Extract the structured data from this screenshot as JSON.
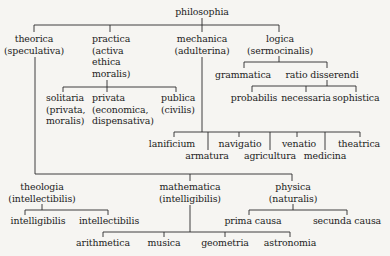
{
  "diagram": {
    "root": "philosophia",
    "level1": {
      "theorica": [
        "theorica",
        "(speculativa)"
      ],
      "practica": [
        "practica",
        "(activa",
        "ethica",
        "moralis)"
      ],
      "mechanica": [
        "mechanica",
        "(adulterina)"
      ],
      "logica": [
        "logica",
        "(sermocinalis)"
      ]
    },
    "practica_children": {
      "solitaria": [
        "solitaria",
        "(privata,",
        "moralis)"
      ],
      "privata": [
        "privata",
        "(economica,",
        "dispensativa)"
      ],
      "publica": [
        "publica",
        "(civilis)"
      ]
    },
    "logica_children": {
      "grammatica": "grammatica",
      "ratio_disserendi": "ratio disserendi"
    },
    "ratio_children": {
      "probabilis": "probabilis",
      "necessaria": "necessaria",
      "sophistica": "sophistica"
    },
    "mechanica_children": {
      "lanificium": "lanificium",
      "armatura": "armatura",
      "navigatio": "navigatio",
      "agricultura": "agricultura",
      "venatio": "venatio",
      "medicina": "medicina",
      "theatrica": "theatrica"
    },
    "theorica_children": {
      "theologia": [
        "theologia",
        "(intellectibilis)"
      ],
      "mathematica": [
        "mathematica",
        "(intelligibilis)"
      ],
      "physica": [
        "physica",
        "(naturalis)"
      ]
    },
    "theologia_children": {
      "intelligibilis": "intelligibilis",
      "intellectibilis": "intellectibilis"
    },
    "physica_children": {
      "prima_causa": "prima causa",
      "secunda_causa": "secunda causa"
    },
    "mathematica_children": {
      "arithmetica": "arithmetica",
      "musica": "musica",
      "geometria": "geometria",
      "astronomia": "astronomia"
    }
  }
}
